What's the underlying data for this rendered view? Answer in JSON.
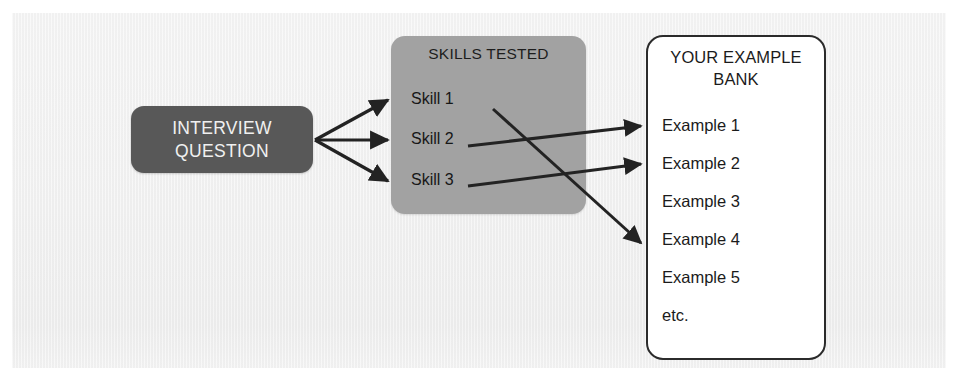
{
  "diagram": {
    "type": "flow",
    "background_color": "#f1f1f1",
    "page_color": "#ffffff",
    "nodes": {
      "interview_question": {
        "id": "interview-question",
        "lines": [
          "INTERVIEW",
          "QUESTION"
        ],
        "fill_color": "#585858",
        "text_color": "#f0f0f0",
        "shape": "rounded-rectangle"
      },
      "skills_tested": {
        "id": "skills-tested",
        "title": "SKILLS TESTED",
        "fill_color": "#a2a2a2",
        "text_color": "#171717",
        "shape": "rounded-rectangle",
        "items": [
          "Skill 1",
          "Skill 2",
          "Skill 3"
        ]
      },
      "example_bank": {
        "id": "example-bank",
        "title": "YOUR EXAMPLE BANK",
        "title_lines": [
          "YOUR EXAMPLE",
          "BANK"
        ],
        "fill_color": "#ffffff",
        "border_color": "#2b2b2b",
        "text_color": "#1b1b1b",
        "shape": "rounded-rectangle",
        "items": [
          "Example 1",
          "Example 2",
          "Example 3",
          "Example 4",
          "Example 5",
          "etc."
        ]
      }
    },
    "connections": [
      {
        "from": "INTERVIEW QUESTION",
        "to": "Skill 1",
        "style": "arrow"
      },
      {
        "from": "INTERVIEW QUESTION",
        "to": "Skill 2",
        "style": "arrow"
      },
      {
        "from": "INTERVIEW QUESTION",
        "to": "Skill 3",
        "style": "arrow"
      },
      {
        "from": "Skill 1",
        "to": "Example 4",
        "style": "arrow"
      },
      {
        "from": "Skill 2",
        "to": "Example 1",
        "style": "arrow"
      },
      {
        "from": "Skill 3",
        "to": "Example 2",
        "style": "arrow"
      }
    ],
    "arrow_color": "#232323"
  }
}
